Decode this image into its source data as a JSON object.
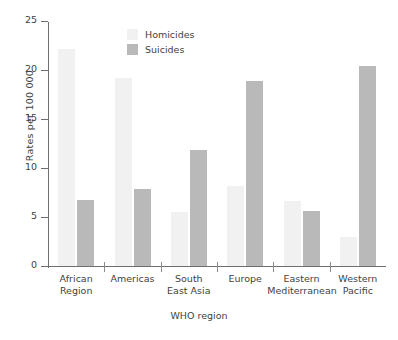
{
  "chart_data": {
    "type": "bar",
    "title": "",
    "xlabel": "WHO region",
    "ylabel": "Rates per 100 000",
    "categories": [
      "African Region",
      "Americas",
      "South East Asia",
      "Europe",
      "Eastern Mediterranean",
      "Western Pacific"
    ],
    "category_lines": [
      [
        "African",
        "Region"
      ],
      [
        "Americas"
      ],
      [
        "South",
        "East Asia"
      ],
      [
        "Europe"
      ],
      [
        "Eastern",
        "Mediterranean"
      ],
      [
        "Western",
        "Pacific"
      ]
    ],
    "series": [
      {
        "name": "Homicides",
        "color": "#f1f1f1",
        "values": [
          22.1,
          19.2,
          5.5,
          8.2,
          6.6,
          3.0
        ]
      },
      {
        "name": "Suicides",
        "color": "#b9b9b9",
        "values": [
          6.7,
          7.9,
          11.8,
          18.9,
          5.6,
          20.4
        ]
      }
    ],
    "ylim": [
      0,
      25
    ],
    "yticks": [
      0,
      5,
      10,
      15,
      20,
      25
    ],
    "ytick_labels": [
      "0",
      "5",
      "10",
      "15",
      "20",
      "25"
    ],
    "grid": false,
    "legend_position": "top-left-inside"
  },
  "legend": {
    "entries": [
      {
        "label": "Homicides",
        "color": "#f1f1f1"
      },
      {
        "label": "Suicides",
        "color": "#b9b9b9"
      }
    ]
  },
  "axes": {
    "y_title": "Rates per 100 000",
    "x_title": "WHO region"
  }
}
